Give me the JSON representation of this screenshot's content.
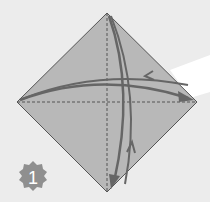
{
  "diagram": {
    "type": "origami-instruction-step",
    "step": {
      "number": "1",
      "badge_color": "#8f8f8f",
      "label_color": "#ffffff"
    },
    "paper": {
      "shape": "square-rotated-45",
      "fill": "#b8b8b8",
      "edge_color": "#555555"
    },
    "crease_lines": [
      {
        "name": "horizontal-diagonal",
        "style": "dashed",
        "from": "left-corner",
        "to": "right-corner"
      },
      {
        "name": "vertical-diagonal",
        "style": "dashed",
        "from": "top-corner",
        "to": "bottom-corner"
      }
    ],
    "fold_arrows": [
      {
        "name": "fold-left-to-right",
        "direction": "left-to-right-and-back",
        "color": "#666666"
      },
      {
        "name": "fold-top-to-bottom",
        "direction": "top-to-bottom-and-back",
        "color": "#666666"
      }
    ],
    "background": {
      "color": "#ececec",
      "highlight_color": "#ffffff"
    }
  }
}
